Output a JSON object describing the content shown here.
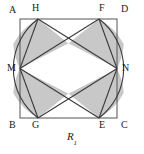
{
  "figure": {
    "caption_base": "R",
    "caption_subscript": "1",
    "colors": {
      "shade_fill": "#c8c8c8",
      "stroke": "#3a3a3a",
      "square_stroke": "#555555",
      "background": "#ffffff",
      "label_color": "#1a1a1a"
    },
    "square": {
      "left": 20,
      "top": 19,
      "right": 117,
      "bottom": 118
    },
    "points": [
      {
        "name": "A",
        "role": "square-corner-top-left",
        "x": 20,
        "y": 19,
        "label_x": 9,
        "label_y": 5
      },
      {
        "name": "H",
        "role": "top-side-point-left",
        "x": 38,
        "y": 19,
        "label_x": 32,
        "label_y": 3
      },
      {
        "name": "F",
        "role": "top-side-point-right",
        "x": 99,
        "y": 19,
        "label_x": 99,
        "label_y": 3
      },
      {
        "name": "D",
        "role": "square-corner-top-right",
        "x": 117,
        "y": 19,
        "label_x": 121,
        "label_y": 4
      },
      {
        "name": "M",
        "role": "left-side-midpoint",
        "x": 20,
        "y": 68.5,
        "label_x": 7,
        "label_y": 63
      },
      {
        "name": "N",
        "role": "right-side-midpoint",
        "x": 117,
        "y": 68.5,
        "label_x": 122,
        "label_y": 63
      },
      {
        "name": "B",
        "role": "square-corner-bottom-left",
        "x": 20,
        "y": 118,
        "label_x": 9,
        "label_y": 120
      },
      {
        "name": "G",
        "role": "bottom-side-point-left",
        "x": 38,
        "y": 118,
        "label_x": 32,
        "label_y": 120
      },
      {
        "name": "E",
        "role": "bottom-side-point-right",
        "x": 99,
        "y": 118,
        "label_x": 99,
        "label_y": 120
      },
      {
        "name": "C",
        "role": "square-corner-bottom-right",
        "x": 117,
        "y": 118,
        "label_x": 121,
        "label_y": 120
      }
    ],
    "crossings": [
      {
        "name": "top-crossing",
        "x": 68.5,
        "y": 43.5
      },
      {
        "name": "bottom-crossing",
        "x": 68.5,
        "y": 93.5
      }
    ],
    "arcs": [
      {
        "name": "arc-H-M-G",
        "from": "H",
        "through": "M",
        "to": "G",
        "bulge": "left",
        "bulge_px": 7
      },
      {
        "name": "arc-F-N-E",
        "from": "F",
        "through": "N",
        "to": "E",
        "bulge": "right",
        "bulge_px": 7
      }
    ],
    "chords": [
      {
        "name": "chord-H-N",
        "from": "H",
        "to": "N"
      },
      {
        "name": "chord-F-M",
        "from": "F",
        "to": "M"
      },
      {
        "name": "chord-G-N",
        "from": "G",
        "to": "N"
      },
      {
        "name": "chord-E-M",
        "from": "E",
        "to": "M"
      },
      {
        "name": "chord-H-M",
        "from": "H",
        "to": "M"
      },
      {
        "name": "chord-G-M",
        "from": "G",
        "to": "M"
      },
      {
        "name": "chord-F-N",
        "from": "F",
        "to": "N"
      },
      {
        "name": "chord-E-N",
        "from": "E",
        "to": "N"
      }
    ],
    "shaded_regions": [
      {
        "name": "region-left-upper",
        "vertices": [
          "H",
          "top-crossing",
          "M"
        ],
        "arc_edge": "arc-H-M"
      },
      {
        "name": "region-left-lower",
        "vertices": [
          "G",
          "bottom-crossing",
          "M"
        ],
        "arc_edge": "arc-M-G"
      },
      {
        "name": "region-right-upper",
        "vertices": [
          "F",
          "top-crossing",
          "N"
        ],
        "arc_edge": "arc-F-N"
      },
      {
        "name": "region-right-lower",
        "vertices": [
          "E",
          "bottom-crossing",
          "N"
        ],
        "arc_edge": "arc-N-E"
      }
    ],
    "white_region": {
      "name": "central-rhombus",
      "vertices": [
        "M",
        "top-crossing",
        "N",
        "bottom-crossing"
      ]
    }
  }
}
